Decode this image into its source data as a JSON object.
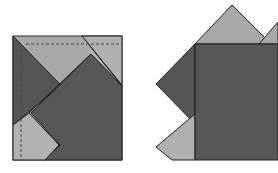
{
  "diagram": {
    "colors": {
      "background": "#ffffff",
      "light_gray": "#b4b4b4",
      "mid_gray": "#9a9a9a",
      "dark_gray": "#5a5a5a",
      "darker_gray": "#4e4e4e",
      "outline": "#1e1e1e",
      "dashed_line": "#4a4a4a"
    },
    "left_figure": {
      "label": "",
      "elements": [
        "square-sheet",
        "left-dark-triangle",
        "top-light-triangle",
        "center-dark-square",
        "bottom-left-light-flap",
        "top-right-flap",
        "vertical-dashed-crease",
        "horizontal-dashed-crease"
      ]
    },
    "right_figure": {
      "label": "",
      "elements": [
        "main-dark-square",
        "top-light-triangle",
        "top-right-light-triangle",
        "left-dark-diamond",
        "bottom-left-light-triangle"
      ]
    }
  }
}
